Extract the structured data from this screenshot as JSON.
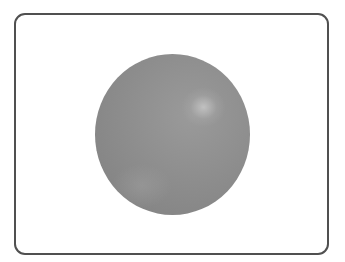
{
  "figure": {
    "description": "Gray shaded sphere inside a rounded rectangle frame",
    "frame": {
      "border_color": "#505050",
      "background": "#ffffff"
    },
    "sphere": {
      "base_color": "#8c8c8c",
      "highlight_color": "#c8c8c8",
      "highlight_position": "upper-right"
    }
  }
}
